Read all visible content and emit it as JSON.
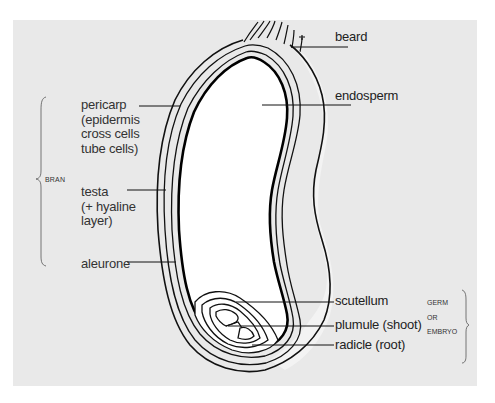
{
  "diagram": {
    "title": "",
    "background_color": "#e9e9e9",
    "labels": {
      "beard": "beard",
      "endosperm": "endosperm",
      "pericarp": "pericarp\n(epidermis\ncross cells\ntube cells)",
      "testa": "testa\n(+ hyaline\nlayer)",
      "aleurone": "aleurone",
      "scutellum": "scutellum",
      "plumule": "plumule (shoot)",
      "radicle": "radicle (root)"
    },
    "groups": {
      "bran": "BRAN",
      "germ": "GERM\nOR\nEMBRYO"
    }
  }
}
